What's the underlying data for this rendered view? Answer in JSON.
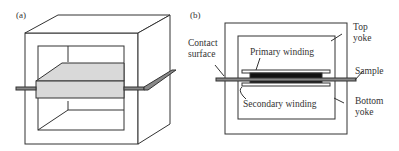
{
  "panels": {
    "a": {
      "label": "(a)"
    },
    "b": {
      "label": "(b)",
      "labels": {
        "contact_surface_1": "Contact",
        "contact_surface_2": "surface",
        "primary_winding": "Primary winding",
        "secondary_winding": "Secondary winding",
        "top_yoke_1": "Top",
        "top_yoke_2": "yoke",
        "sample": "Sample",
        "bottom_yoke_1": "Bottom",
        "bottom_yoke_2": "yoke"
      }
    }
  },
  "colors": {
    "line": "#333333",
    "sample_fill": "#d9d9d9",
    "winding_fill": "#111111",
    "strip_fill": "#888888"
  }
}
